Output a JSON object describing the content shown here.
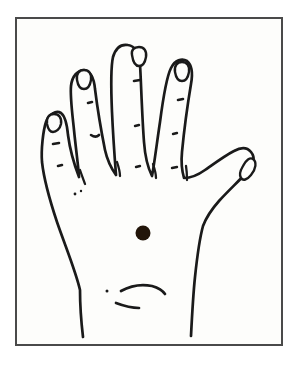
{
  "figure": {
    "title": "Hand outline diagram with marked point on palm",
    "kind": "line-drawing",
    "caption": "",
    "view": "dorsal view of left hand, fingers spread, thumb to the right",
    "canvas": {
      "width": 304,
      "height": 367,
      "background_color": "#ffffff"
    },
    "frame": {
      "name": "border-frame",
      "x": 16,
      "y": 18,
      "width": 266,
      "height": 327,
      "stroke_color": "#4a4a4a",
      "stroke_width": 2,
      "fill_color": "#fdfdfb"
    },
    "ink_color": "#1a1a1a",
    "marker": {
      "label": "acupoint marker",
      "shape": "filled-circle",
      "color": "#221509",
      "center_x": 143,
      "center_y": 233,
      "diameter": 15
    },
    "parts": [
      {
        "name": "hand-outline",
        "label": "Hand outline",
        "count": 1
      },
      {
        "name": "little-finger",
        "label": "Little finger",
        "tip_x": 53,
        "tip_y": 113
      },
      {
        "name": "ring-finger",
        "label": "Ring finger",
        "tip_x": 93,
        "tip_y": 68
      },
      {
        "name": "middle-finger",
        "label": "Middle finger",
        "tip_x": 139,
        "tip_y": 48
      },
      {
        "name": "index-finger",
        "label": "Index finger",
        "tip_x": 182,
        "tip_y": 63
      },
      {
        "name": "thumb",
        "label": "Thumb",
        "tip_x": 252,
        "tip_y": 162
      },
      {
        "name": "fingernails",
        "label": "Fingernails",
        "count": 5
      },
      {
        "name": "knuckle-marks",
        "label": "Knuckle and joint marks",
        "count": 9
      },
      {
        "name": "wrist-creases",
        "label": "Wrist crease lines",
        "count": 2
      }
    ],
    "labels": {
      "frame_label": "",
      "marker_label": "",
      "figure_number": ""
    }
  }
}
